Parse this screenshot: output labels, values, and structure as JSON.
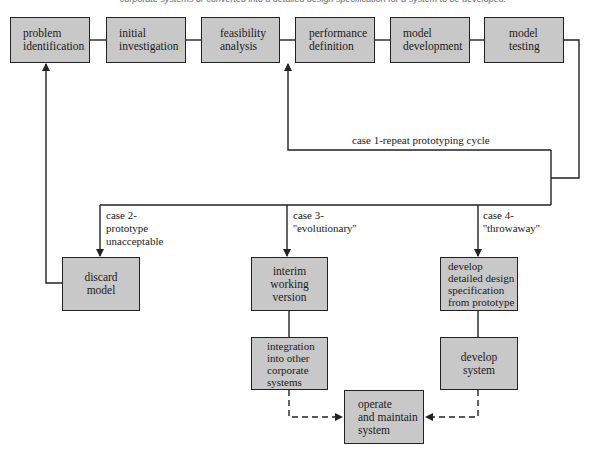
{
  "caption": "corporate systems or converted into a detailed design specification for a system to be developed.",
  "colors": {
    "box_fill": "#c8c8c8",
    "line": "#222222",
    "background": "#ffffff"
  },
  "top_row": [
    {
      "id": "problem-identification",
      "lines": [
        "problem",
        "identification"
      ]
    },
    {
      "id": "initial-investigation",
      "lines": [
        "initial",
        "investigation"
      ]
    },
    {
      "id": "feasibility-analysis",
      "lines": [
        "feasibility",
        "analysis"
      ]
    },
    {
      "id": "performance-definition",
      "lines": [
        "performance",
        "definition"
      ]
    },
    {
      "id": "model-development",
      "lines": [
        "model",
        "development"
      ]
    },
    {
      "id": "model-testing",
      "lines": [
        "model",
        "testing"
      ]
    }
  ],
  "loop_label": "case 1-repeat prototyping cycle",
  "cases": [
    {
      "id": "case-2",
      "lines": [
        "case 2-",
        "prototype",
        "unacceptable"
      ]
    },
    {
      "id": "case-3",
      "lines": [
        "case 3-",
        "''evolutionary''"
      ]
    },
    {
      "id": "case-4",
      "lines": [
        "case 4-",
        "''throwaway''"
      ]
    }
  ],
  "outcome_boxes": [
    {
      "id": "discard-model",
      "lines": [
        "discard",
        "model"
      ]
    },
    {
      "id": "interim-working-version",
      "lines": [
        "interim",
        "working",
        "version"
      ]
    },
    {
      "id": "develop-detailed-design",
      "lines": [
        "develop",
        "detailed design",
        "specification",
        "from prototype"
      ]
    },
    {
      "id": "integration-into-other-corporate-systems",
      "lines": [
        "integration",
        "into other",
        "corporate",
        "systems"
      ]
    },
    {
      "id": "develop-system",
      "lines": [
        "develop",
        "system"
      ]
    },
    {
      "id": "operate-and-maintain-system",
      "lines": [
        "operate",
        "and maintain",
        "system"
      ]
    }
  ]
}
